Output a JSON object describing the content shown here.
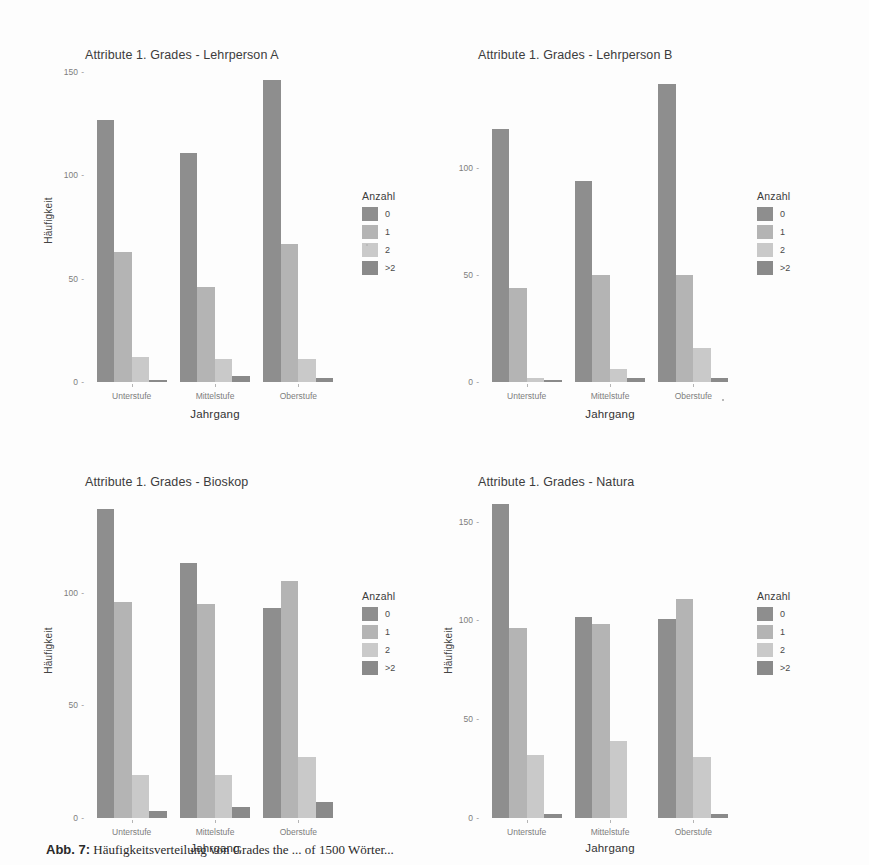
{
  "figure": {
    "caption_label": "Abb. 7:",
    "caption_text": "Häufigkeitsverteilung von Grades the ... of 1500 Wörter..."
  },
  "legend": {
    "title": "Anzahl",
    "entries": [
      {
        "label": "0",
        "color": "#8e8e8e"
      },
      {
        "label": "1",
        "color": "#b4b4b4"
      },
      {
        "label": "2",
        "color": "#c9c9c9"
      },
      {
        "label": ">2",
        "color": "#8a8a8a"
      }
    ]
  },
  "axes": {
    "xlabel": "Jahrgang",
    "ylabel": "Häufigkeit",
    "categories": [
      "Unterstufe",
      "Mittelstufe",
      "Oberstufe"
    ]
  },
  "chart_data": [
    {
      "type": "bar",
      "title": "Attribute 1. Grades - Lehrperson A",
      "xlabel": "Jahrgang",
      "ylabel": "Häufigkeit",
      "categories": [
        "Unterstufe",
        "Mittelstufe",
        "Oberstufe"
      ],
      "legend_title": "Anzahl",
      "legend_position": "right",
      "grid": false,
      "ylim": [
        0,
        152
      ],
      "yticks": [
        0,
        50,
        100,
        150
      ],
      "series": [
        {
          "name": "0",
          "values": [
            127,
            111,
            146
          ]
        },
        {
          "name": "1",
          "values": [
            63,
            46,
            67
          ]
        },
        {
          "name": "2",
          "values": [
            12,
            11,
            11
          ]
        },
        {
          "name": ">2",
          "values": [
            1,
            3,
            2
          ]
        }
      ]
    },
    {
      "type": "bar",
      "title": "Attribute 1. Grades - Lehrperson B",
      "xlabel": "Jahrgang",
      "ylabel": "Häufigkeit",
      "categories": [
        "Unterstufe",
        "Mittelstufe",
        "Oberstufe"
      ],
      "legend_title": "Anzahl",
      "legend_position": "right",
      "grid": false,
      "ylim": [
        0,
        142
      ],
      "yticks": [
        0,
        50,
        100
      ],
      "series": [
        {
          "name": "0",
          "values": [
            118,
            94,
            139
          ]
        },
        {
          "name": "1",
          "values": [
            44,
            50,
            50
          ]
        },
        {
          "name": "2",
          "values": [
            2,
            6,
            16
          ]
        },
        {
          "name": ">2",
          "values": [
            1,
            2,
            2
          ]
        }
      ]
    },
    {
      "type": "bar",
      "title": "Attribute 1. Grades - Bioskop",
      "xlabel": "Jahrgang",
      "ylabel": "Häufigkeit",
      "categories": [
        "Unterstufe",
        "Mittelstufe",
        "Oberstufe"
      ],
      "legend_title": "Anzahl",
      "legend_position": "right",
      "grid": false,
      "ylim": [
        0,
        142
      ],
      "yticks": [
        0,
        50,
        100
      ],
      "series": [
        {
          "name": "0",
          "values": [
            137,
            113,
            93
          ]
        },
        {
          "name": "1",
          "values": [
            96,
            95,
            105
          ]
        },
        {
          "name": "2",
          "values": [
            19,
            19,
            27
          ]
        },
        {
          "name": ">2",
          "values": [
            3,
            5,
            7
          ]
        }
      ]
    },
    {
      "type": "bar",
      "title": "Attribute 1. Grades - Natura",
      "xlabel": "Jahrgang",
      "ylabel": "Häufigkeit",
      "categories": [
        "Unterstufe",
        "Mittelstufe",
        "Oberstufe"
      ],
      "legend_title": "Anzahl",
      "legend_position": "right",
      "grid": false,
      "ylim": [
        0,
        162
      ],
      "yticks": [
        0,
        50,
        100,
        150
      ],
      "series": [
        {
          "name": "0",
          "values": [
            159,
            102,
            101
          ]
        },
        {
          "name": "1",
          "values": [
            96,
            98,
            111
          ]
        },
        {
          "name": "2",
          "values": [
            32,
            39,
            31
          ]
        },
        {
          "name": ">2",
          "values": [
            2,
            0,
            2
          ]
        }
      ]
    }
  ]
}
